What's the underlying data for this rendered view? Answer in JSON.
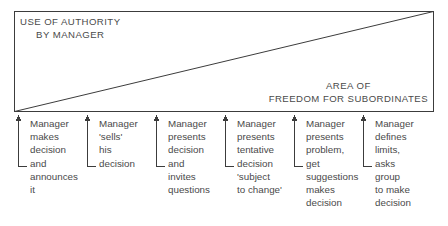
{
  "diagram": {
    "title_implied": "Continuum of manager-subordinate decision behaviour",
    "box": {
      "authority_label": {
        "line1": "USE OF AUTHORITY",
        "line2": "BY MANAGER"
      },
      "freedom_label": {
        "line1": "AREA OF",
        "line2": "FREEDOM FOR SUBORDINATES"
      }
    },
    "columns": [
      {
        "index": 1,
        "arrow_icon": "arrow-up-elbow-icon",
        "lines": [
          "Manager",
          "makes",
          "decision",
          "and",
          "announces",
          "it"
        ]
      },
      {
        "index": 2,
        "arrow_icon": "arrow-up-elbow-icon",
        "lines": [
          "Manager",
          "'sells'",
          "his",
          "decision"
        ]
      },
      {
        "index": 3,
        "arrow_icon": "arrow-up-elbow-icon",
        "lines": [
          "Manager",
          "presents",
          "decision",
          "and",
          "invites",
          "questions"
        ]
      },
      {
        "index": 4,
        "arrow_icon": "arrow-up-elbow-icon",
        "lines": [
          "Manager",
          "presents",
          "tentative",
          "decision",
          "'subject",
          "to change'"
        ]
      },
      {
        "index": 5,
        "arrow_icon": "arrow-up-elbow-icon",
        "lines": [
          "Manager",
          "presents",
          "problem,",
          "get",
          "suggestions",
          "makes",
          "decision"
        ]
      },
      {
        "index": 6,
        "arrow_icon": "arrow-up-elbow-icon",
        "lines": [
          "Manager",
          "defines",
          "limits,",
          "asks",
          "group",
          "to make",
          "decision"
        ]
      }
    ],
    "colors": {
      "stroke": "#3c3c3c",
      "text": "#4a4a4a",
      "background": "#ffffff"
    }
  }
}
